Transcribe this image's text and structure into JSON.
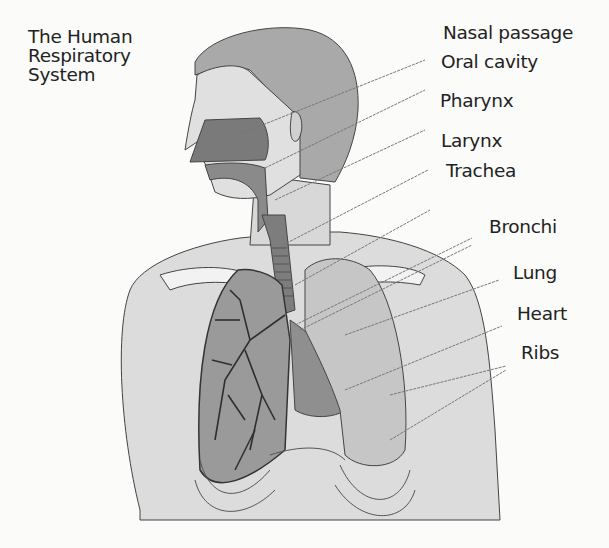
{
  "title": {
    "lines": [
      "The Human",
      "Respiratory",
      "System"
    ]
  },
  "labels": [
    {
      "id": "nasal-passage",
      "text": "Nasal passage",
      "x": 443,
      "y": 22
    },
    {
      "id": "oral-cavity",
      "text": "Oral cavity",
      "x": 441,
      "y": 51
    },
    {
      "id": "pharynx",
      "text": "Pharynx",
      "x": 440,
      "y": 90
    },
    {
      "id": "larynx",
      "text": "Larynx",
      "x": 441,
      "y": 130
    },
    {
      "id": "trachea",
      "text": "Trachea",
      "x": 446,
      "y": 160
    },
    {
      "id": "bronchi",
      "text": "Bronchi",
      "x": 489,
      "y": 216
    },
    {
      "id": "lung",
      "text": "Lung",
      "x": 513,
      "y": 262
    },
    {
      "id": "heart",
      "text": "Heart",
      "x": 517,
      "y": 303
    },
    {
      "id": "ribs",
      "text": "Ribs",
      "x": 521,
      "y": 342
    }
  ]
}
